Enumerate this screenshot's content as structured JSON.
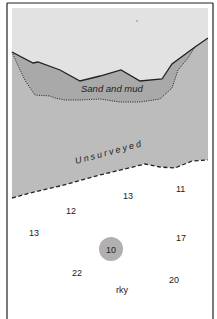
{
  "map": {
    "colors": {
      "land": "#e2e2e2",
      "sand_and_mud": "#a9a9a9",
      "unsurveyed": "#bcbcbc",
      "surveyed_water": "#ffffff",
      "ink": "#222222",
      "rock": "#b0b0b0"
    },
    "labels": {
      "sand_and_mud": "Sand and mud",
      "unsurveyed": "Unsurveyed",
      "rocky": "rky"
    },
    "soundings": [
      {
        "value": "13",
        "x": 128,
        "y": 199
      },
      {
        "value": "11",
        "x": 181,
        "y": 192
      },
      {
        "value": "12",
        "x": 71,
        "y": 214
      },
      {
        "value": "13",
        "x": 34,
        "y": 236
      },
      {
        "value": "17",
        "x": 181,
        "y": 241
      },
      {
        "value": "22",
        "x": 77,
        "y": 276
      },
      {
        "value": "20",
        "x": 174,
        "y": 283
      }
    ],
    "rock_sounding": {
      "value": "10",
      "x": 111,
      "y": 253
    }
  }
}
